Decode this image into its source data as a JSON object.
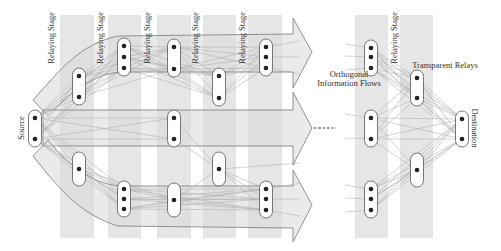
{
  "diagram": {
    "labels": {
      "source": "Source",
      "destination": "Destination",
      "relaying_stage": "Relaying Stage",
      "orthogonal_flows_line1": "Orthogonal",
      "orthogonal_flows_line2": "Information Flows",
      "transparent_relays": "Transparent Relays"
    },
    "stage_labels": [
      "Relaying Stage",
      "Relaying Stage",
      "Relaying Stage",
      "Relaying Stage",
      "Relaying Stage",
      "Relaying Stage"
    ],
    "flows": [
      "top-flow",
      "middle-flow",
      "bottom-flow"
    ],
    "nodes": [
      {
        "id": "source",
        "role": "source",
        "antennas": 2
      },
      {
        "id": "s1-top",
        "stage": 1,
        "flow": "top",
        "antennas": 2
      },
      {
        "id": "s1-bottom",
        "stage": 1,
        "flow": "bottom",
        "antennas": 1
      },
      {
        "id": "s2-top",
        "stage": 2,
        "flow": "top",
        "antennas": 3
      },
      {
        "id": "s2-bottom",
        "stage": 2,
        "flow": "bottom",
        "antennas": 3
      },
      {
        "id": "s3-top",
        "stage": 3,
        "flow": "top",
        "antennas": 2
      },
      {
        "id": "s3-middle",
        "stage": 3,
        "flow": "middle",
        "antennas": 2
      },
      {
        "id": "s3-bottom",
        "stage": 3,
        "flow": "bottom",
        "antennas": 1
      },
      {
        "id": "s4-top",
        "stage": 4,
        "flow": "top",
        "antennas": 2
      },
      {
        "id": "s4-middle",
        "stage": 4,
        "flow": "middle",
        "antennas": 1
      },
      {
        "id": "s5-top",
        "stage": 5,
        "flow": "top",
        "antennas": 3
      },
      {
        "id": "s5-bottom",
        "stage": 5,
        "flow": "bottom",
        "antennas": 3
      },
      {
        "id": "r1-top",
        "stage": "last-1",
        "flow": "top",
        "antennas": 3
      },
      {
        "id": "r1-middle",
        "stage": "last-1",
        "flow": "middle",
        "antennas": 2
      },
      {
        "id": "r1-bottom",
        "stage": "last-1",
        "flow": "bottom",
        "antennas": 3
      },
      {
        "id": "r2-top",
        "stage": "last",
        "role": "transparent-relay",
        "antennas": 2
      },
      {
        "id": "r2-bottom",
        "stage": "last",
        "role": "transparent-relay",
        "antennas": 1
      },
      {
        "id": "destination",
        "role": "destination",
        "antennas": 2
      }
    ],
    "continuation": "dashed-ellipsis"
  }
}
